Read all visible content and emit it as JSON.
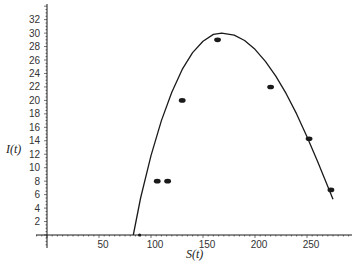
{
  "chart_data": {
    "type": "scatter",
    "title": "",
    "xlabel": "S(t)",
    "ylabel": "I(t)",
    "xlim": [
      0,
      300
    ],
    "ylim": [
      0,
      34
    ],
    "x_ticks": [
      50,
      100,
      150,
      200,
      250
    ],
    "y_ticks": [
      2,
      4,
      6,
      8,
      10,
      12,
      14,
      16,
      18,
      20,
      22,
      24,
      26,
      28,
      30,
      32
    ],
    "grid": false,
    "legend": null,
    "series": [
      {
        "name": "data points",
        "type": "scatter",
        "x": [
          106,
          116,
          130,
          164,
          215,
          252,
          273
        ],
        "y": [
          8,
          8,
          20,
          29,
          22,
          14.3,
          6.7
        ]
      },
      {
        "name": "fitted curve",
        "type": "line",
        "x": [
          83,
          90,
          100,
          110,
          120,
          130,
          140,
          150,
          160,
          168,
          180,
          190,
          200,
          210,
          220,
          230,
          240,
          250,
          260,
          270,
          275
        ],
        "y": [
          0,
          5.5,
          11.8,
          17.0,
          21.2,
          24.6,
          27.1,
          28.8,
          29.8,
          30.0,
          29.7,
          28.9,
          27.6,
          25.8,
          23.6,
          21.0,
          18.0,
          14.6,
          11.0,
          7.2,
          5.3
        ]
      },
      {
        "name": "initial point",
        "type": "scatter",
        "x": [
          89
        ],
        "y": [
          0
        ]
      }
    ]
  },
  "axes": {
    "x_label": "S(t)",
    "y_label": "I(t)"
  },
  "colors": {
    "ink": "#1a1a1a",
    "background": "#ffffff"
  }
}
